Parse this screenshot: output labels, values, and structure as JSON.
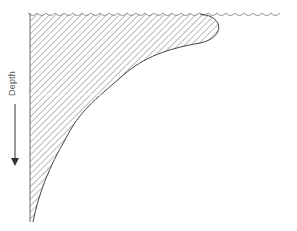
{
  "diagram": {
    "axis_label": "Depth",
    "colors": {
      "line": "#444444",
      "hatch": "#777777",
      "surface": "#888888",
      "background": "#ffffff"
    }
  }
}
